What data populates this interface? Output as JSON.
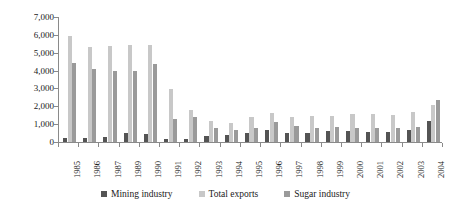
{
  "chart_data": {
    "type": "bar",
    "title": "",
    "xlabel": "",
    "ylabel": "Pesos (Millions)",
    "ylim": [
      0,
      7000
    ],
    "ytick_values": [
      7000,
      6000,
      5000,
      4000,
      3000,
      2000,
      1000,
      0
    ],
    "ytick_labels": [
      "7,000",
      "6,000",
      "5,000",
      "4,000",
      "3,000",
      "2,000",
      "1,000",
      "0"
    ],
    "grid": false,
    "legend_position": "bottom",
    "categories": [
      "1985",
      "1986",
      "1987",
      "1989",
      "1990",
      "1991",
      "1992",
      "1993",
      "1994",
      "1995",
      "1996",
      "1997",
      "1998",
      "1999",
      "2000",
      "2001",
      "2002",
      "2003",
      "2004"
    ],
    "series": [
      {
        "name": "Mining industry",
        "color": "#545454",
        "values": [
          250,
          250,
          300,
          520,
          450,
          180,
          170,
          330,
          420,
          500,
          700,
          530,
          480,
          620,
          640,
          560,
          560,
          660,
          1150
        ]
      },
      {
        "name": "Total exports",
        "color": "#c8c8c8",
        "values": [
          5950,
          5320,
          5400,
          5420,
          5420,
          2990,
          1780,
          1200,
          1080,
          1380,
          1620,
          1420,
          1450,
          1470,
          1560,
          1580,
          1540,
          1670,
          2070
        ]
      },
      {
        "name": "Sugar industry",
        "color": "#9a9a9a",
        "values": [
          4450,
          4100,
          4000,
          3960,
          4350,
          1300,
          1380,
          800,
          700,
          810,
          1110,
          890,
          760,
          860,
          780,
          790,
          790,
          840,
          2330
        ]
      }
    ]
  },
  "legend": {
    "items": [
      {
        "label": "Mining industry",
        "color": "#545454"
      },
      {
        "label": "Total exports",
        "color": "#c8c8c8"
      },
      {
        "label": "Sugar industry",
        "color": "#9a9a9a"
      }
    ]
  }
}
